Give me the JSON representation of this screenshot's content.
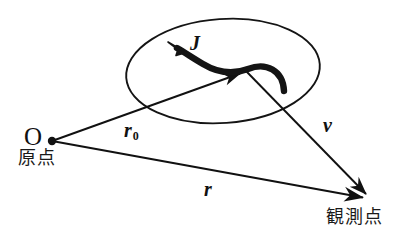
{
  "figure": {
    "background_color": "#ffffff",
    "stroke_color": "#111111",
    "width": 415,
    "height": 239
  },
  "labels": {
    "current_density": "J",
    "source_vector": "r",
    "source_vector_subscript": "0",
    "relative_vector": "v",
    "observation_vector": "r",
    "origin_symbol": "O",
    "origin_caption": "原点",
    "observation_caption": "観測点"
  },
  "shapes": {
    "region_ellipse": {
      "name": "current-region-ellipse",
      "center_x": 223,
      "center_y": 71,
      "radius_x": 97,
      "radius_y": 52,
      "rotation_deg": -4,
      "filled": false
    },
    "origin_dot": {
      "x": 52,
      "y": 141,
      "radius": 4
    }
  },
  "vectors": [
    {
      "name": "r0",
      "symbol": "r",
      "subscript": "0",
      "from": {
        "x": 52,
        "y": 141
      },
      "to": {
        "x": 246,
        "y": 71
      },
      "label_x": 124,
      "label_y": 120
    },
    {
      "name": "v",
      "symbol": "v",
      "from": {
        "x": 246,
        "y": 71
      },
      "to": {
        "x": 372,
        "y": 200
      },
      "label_x": 323,
      "label_y": 115
    },
    {
      "name": "r",
      "symbol": "r",
      "from": {
        "x": 52,
        "y": 141
      },
      "to": {
        "x": 371,
        "y": 199
      },
      "label_x": 204,
      "label_y": 179
    }
  ],
  "current_arrow": {
    "name": "current-density-curved-arrow",
    "description": "thick S-shaped curved arrow inside the ellipse pointing up-left",
    "tail": {
      "x": 284,
      "y": 91
    },
    "head": {
      "x": 171,
      "y": 46
    },
    "stroke_width": 6
  }
}
